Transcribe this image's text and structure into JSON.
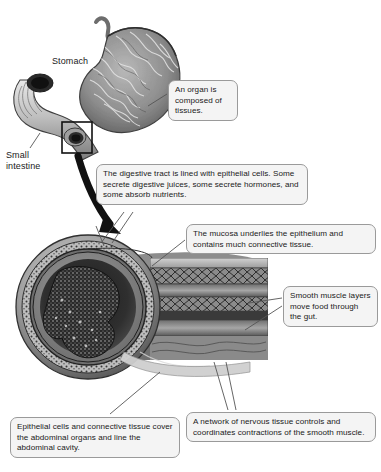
{
  "figure": {
    "type": "anatomical-diagram",
    "palette": {
      "background": "#ffffff",
      "callout_fill": "#f4f4f4",
      "callout_border": "#9a9a9a",
      "text": "#1a1a1a",
      "leader_line": "#555555",
      "arrow": "#111111",
      "tissue_dark": "#2b2b2b",
      "tissue_mid": "#7d7d7d",
      "tissue_light": "#c9c9c9"
    }
  },
  "labels": {
    "stomach": "Stomach",
    "small_intestine": "Small\nintestine"
  },
  "callouts": {
    "organ": "An organ is composed of tissues.",
    "digestive_tract": "The digestive tract is lined with epithelial cells. Some secrete digestive juices, some secrete hormones, and some absorb nutrients.",
    "mucosa": "The mucosa underlies the epithelium and contains much connective tissue.",
    "smooth_muscle": "Smooth muscle layers move food through the gut.",
    "epithelial_serosa": "Epithelial cells and connective tissue cover the abdominal organs and line the abdominal cavity.",
    "nervous_network": "A network of nervous tissue controls and coordinates contractions of the smooth muscle."
  }
}
